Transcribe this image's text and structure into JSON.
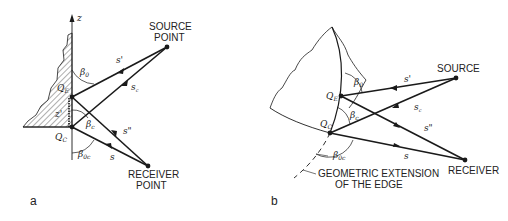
{
  "figure": {
    "panel_a": {
      "label": "a",
      "axis_label": "z",
      "source_label_line1": "SOURCE",
      "source_label_line2": "POINT",
      "receiver_label_line1": "RECEIVER",
      "receiver_label_line2": "POINT",
      "point_edge": "Q",
      "point_edge_sub": "E",
      "point_corner": "Q",
      "point_corner_sub": "C",
      "angle_beta0": "β",
      "angle_beta0_sub": "0",
      "angle_betac": "β",
      "angle_betac_sub": "c",
      "angle_beta0c": "β",
      "angle_beta0c_sub": "0c",
      "ray_s_prime": "s'",
      "ray_sc": "s",
      "ray_sc_sub": "c",
      "ray_s_double": "s\"",
      "ray_s": "s",
      "offset_z": "z'"
    },
    "panel_b": {
      "label": "b",
      "source_label": "SOURCE",
      "receiver_label": "RECEIVER",
      "extension_label_line1": "GEOMETRIC EXTENSION",
      "extension_label_line2": "OF THE EDGE",
      "point_edge": "Q",
      "point_edge_sub": "E",
      "point_corner": "Q",
      "point_corner_sub": "C",
      "angle_beta0": "β",
      "angle_beta0_sub": "0",
      "angle_betac": "β",
      "angle_betac_sub": "c",
      "angle_beta0c": "β",
      "angle_beta0c_sub": "0c",
      "ray_s_prime": "s'",
      "ray_sc": "s",
      "ray_sc_sub": "c",
      "ray_s_double": "s\"",
      "ray_s": "s"
    },
    "colors": {
      "ink": "#1a1a1a",
      "background": "#ffffff"
    }
  }
}
